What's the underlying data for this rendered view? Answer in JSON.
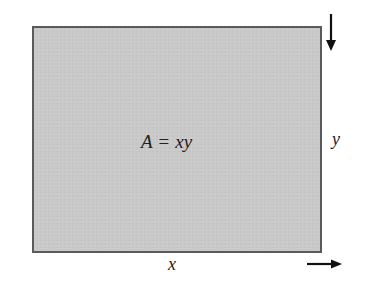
{
  "diagram": {
    "type": "rectangle-area",
    "shape": {
      "name": "rectangle",
      "fill_color": "#c9c9c9",
      "border_color": "#5a5a5a"
    },
    "formula": {
      "lhs": "A",
      "operator": "=",
      "rhs": "xy"
    },
    "labels": {
      "width": "x",
      "height": "y"
    },
    "arrows": [
      {
        "name": "down-arrow",
        "direction": "down",
        "meaning": "height direction"
      },
      {
        "name": "right-arrow",
        "direction": "right",
        "meaning": "width direction"
      }
    ],
    "arrow_color": "#111111"
  }
}
